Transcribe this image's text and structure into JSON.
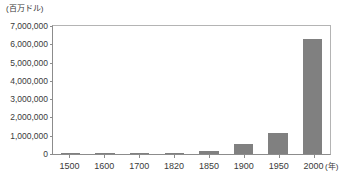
{
  "chart_data": {
    "type": "bar",
    "title": "",
    "subtitle": "",
    "xlabel": "(年)",
    "ylabel": "(百万ドル)",
    "categories": [
      "1500",
      "1600",
      "1700",
      "1820",
      "1850",
      "1900",
      "1950",
      "2000"
    ],
    "values": [
      20000,
      30000,
      40000,
      70000,
      150000,
      540000,
      1130000,
      6270000
    ],
    "series": [
      {
        "name": "",
        "values": [
          20000,
          30000,
          40000,
          70000,
          150000,
          540000,
          1130000,
          6270000
        ]
      }
    ],
    "ylim": [
      0,
      7000000
    ],
    "ytick_labels": [
      "0",
      "1,000,000",
      "2,000,000",
      "3,000,000",
      "4,000,000",
      "5,000,000",
      "6,000,000",
      "7,000,000"
    ],
    "ytick_values": [
      0,
      1000000,
      2000000,
      3000000,
      4000000,
      5000000,
      6000000,
      7000000
    ],
    "grid": false,
    "legend": null,
    "bar_color": "#808080",
    "axis_color": "#8c8c8c",
    "frame_color": "#b4b4b4",
    "background": "#ffffff"
  },
  "axes": {
    "y_unit_caption": "(百万ドル)",
    "x_unit_caption": "(年)"
  },
  "notes": {
    "source_clipped": ""
  }
}
